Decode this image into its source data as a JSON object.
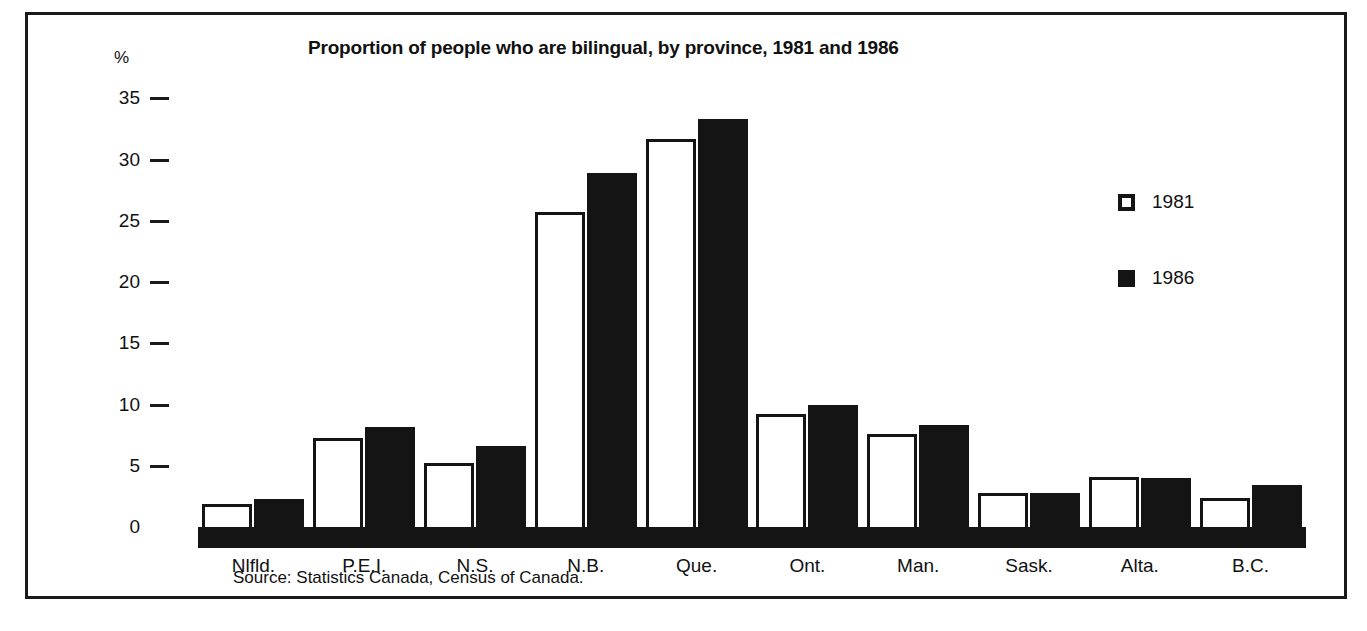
{
  "figure": {
    "source_note": "Source: Statistics Canada, Census of Canada.",
    "border_color": "#1a1a1a",
    "background": "#ffffff"
  },
  "legend": {
    "position": "right",
    "items": [
      {
        "label": "1981",
        "swatch": "open-square-icon",
        "color": "#ffffff",
        "border": "#141414"
      },
      {
        "label": "1986",
        "swatch": "filled-square-icon",
        "color": "#141414",
        "border": "#141414"
      }
    ]
  },
  "chart_data": {
    "type": "bar",
    "title": "Proportion of people who are bilingual, by province, 1981 and 1986",
    "xlabel": "",
    "ylabel": "%",
    "ylim": [
      0,
      36
    ],
    "yticks": [
      0,
      5,
      10,
      15,
      20,
      25,
      30,
      35
    ],
    "ytick_labels": [
      "0",
      "5",
      "10",
      "15",
      "20",
      "25",
      "30",
      "35"
    ],
    "grid": false,
    "legend_position": "right",
    "categories": [
      "Nlfld.",
      "P.E.I.",
      "N.S.",
      "N.B.",
      "Que.",
      "Ont.",
      "Man.",
      "Sask.",
      "Alta.",
      "B.C."
    ],
    "series": [
      {
        "name": "1981",
        "color": "#ffffff",
        "edge_color": "#141414",
        "values": [
          1.9,
          7.3,
          5.2,
          25.7,
          31.7,
          9.2,
          7.6,
          2.8,
          4.1,
          2.4
        ]
      },
      {
        "name": "1986",
        "color": "#141414",
        "edge_color": "#141414",
        "values": [
          2.3,
          8.2,
          6.6,
          28.9,
          33.3,
          10.0,
          8.3,
          2.8,
          4.0,
          3.4
        ]
      }
    ]
  }
}
